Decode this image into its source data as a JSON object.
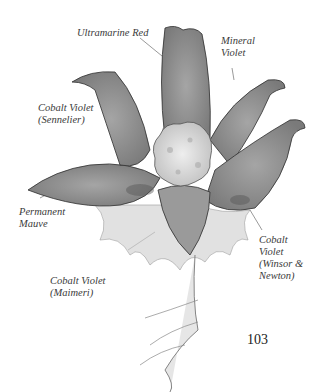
{
  "illustration": {
    "subject": "watercolor flower",
    "colors": {
      "petal_fill": "#8e8e8e",
      "petal_dark": "#5e5e5e",
      "center_fill": "#dcdcdc",
      "outline": "#2e2e2e",
      "wash": "#c8c8c8"
    }
  },
  "labels": [
    {
      "lines": [
        "Ultramarine Red"
      ]
    },
    {
      "lines": [
        "Mineral",
        "Violet"
      ]
    },
    {
      "lines": [
        "Cobalt Violet",
        "(Sennelier)"
      ]
    },
    {
      "lines": [
        "Permanent",
        "Mauve"
      ]
    },
    {
      "lines": [
        "Cobalt",
        "Violet",
        "(Winsor &",
        "Newton)"
      ]
    },
    {
      "lines": [
        "Cobalt Violet",
        "(Maimeri)"
      ]
    }
  ],
  "page_number": "103"
}
